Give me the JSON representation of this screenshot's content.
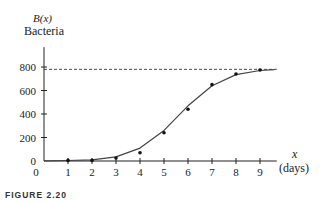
{
  "chart_data": {
    "type": "scatter",
    "title": "",
    "xlabel": "x (days)",
    "ylabel": "B(x) Bacteria",
    "x_ticks": [
      0,
      1,
      2,
      3,
      4,
      5,
      6,
      7,
      8,
      9
    ],
    "y_ticks": [
      0,
      200,
      400,
      600,
      800
    ],
    "xlim": [
      0,
      9.7
    ],
    "ylim": [
      0,
      850
    ],
    "grid": false,
    "asymptote": {
      "y": 780,
      "style": "dashed"
    },
    "series": [
      {
        "name": "observed",
        "kind": "points",
        "x": [
          1,
          2,
          3,
          4,
          5,
          6,
          7,
          8,
          9
        ],
        "y": [
          5,
          5,
          25,
          70,
          240,
          440,
          650,
          740,
          775
        ]
      },
      {
        "name": "logistic fit",
        "kind": "curve",
        "x": [
          0,
          1,
          2,
          3,
          4,
          5,
          6,
          7,
          8,
          9,
          9.6
        ],
        "y": [
          2,
          4,
          10,
          35,
          110,
          260,
          470,
          640,
          735,
          770,
          778
        ]
      }
    ]
  },
  "labels": {
    "y_func": "B(x)",
    "y_name": "Bacteria",
    "x_var": "x",
    "x_unit": "(days)",
    "caption": "FIGURE 2.20"
  }
}
